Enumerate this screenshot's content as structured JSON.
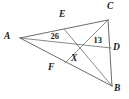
{
  "figure": {
    "type": "geometry-diagram",
    "canvas": {
      "width": 129,
      "height": 99,
      "background": "#ffffff"
    },
    "stroke_color": "#5a5a5a",
    "text_color": "#1a1a1a"
  },
  "points": {
    "A": {
      "label": "A",
      "x": 20,
      "y": 38,
      "label_x": 4,
      "label_y": 32
    },
    "B": {
      "label": "B",
      "x": 112,
      "y": 86,
      "label_x": 114,
      "label_y": 84
    },
    "C": {
      "label": "C",
      "x": 108,
      "y": 20,
      "label_x": 107,
      "label_y": 2
    },
    "D": {
      "label": "D",
      "x": 111,
      "y": 48,
      "label_x": 113,
      "label_y": 43
    },
    "E": {
      "label": "E",
      "x": 64,
      "y": 29,
      "label_x": 59,
      "label_y": 10
    },
    "F": {
      "label": "F",
      "x": 66,
      "y": 62,
      "label_x": 48,
      "label_y": 63
    },
    "X": {
      "label": "X",
      "x": 80,
      "y": 50,
      "label_x": 71,
      "label_y": 54
    }
  },
  "segments": [
    {
      "name": "side-AC",
      "from": "A",
      "to": "C"
    },
    {
      "name": "side-AB",
      "from": "A",
      "to": "B"
    },
    {
      "name": "side-CB",
      "from": "C",
      "to": "B"
    },
    {
      "name": "median-AD",
      "from": "A",
      "to": "D"
    },
    {
      "name": "median-BE",
      "from": "B",
      "to": "E"
    },
    {
      "name": "median-CF",
      "from": "C",
      "to": "F"
    }
  ],
  "measures": [
    {
      "name": "measure-26",
      "value": "26",
      "on_segment": "median-AD",
      "x": 50,
      "y": 32
    },
    {
      "name": "measure-13",
      "value": "13",
      "on_segment": "median-AD",
      "x": 93,
      "y": 36
    }
  ]
}
